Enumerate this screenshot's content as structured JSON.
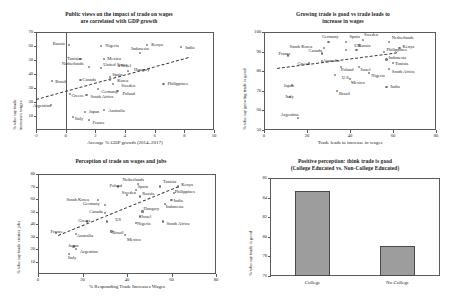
{
  "figure": {
    "panels": [
      "trade-wages-vs-gdp",
      "growing-trade-good-vs-wages",
      "trade-wages-and-jobs",
      "positive-perception-by-education"
    ]
  },
  "chart_data": [
    {
      "id": "trade-wages-vs-gdp",
      "type": "scatter",
      "title": "Public views on the impact of trade on wages",
      "title2": "are correlated with GDP growth",
      "xlabel": "Average % GDP growth (2014–2017)",
      "ylabel": "% who say trade",
      "ylabel2": "increases wages",
      "xlim": [
        -2,
        10
      ],
      "ylim": [
        0,
        70
      ],
      "xticks": [
        -2,
        0,
        2,
        4,
        6,
        8,
        10
      ],
      "yticks": [
        10,
        20,
        30,
        40,
        50,
        60,
        70
      ],
      "grid": false,
      "legend": "none",
      "trendline": {
        "x0": -2,
        "y0": 22,
        "x1": 8.3,
        "y1": 52
      },
      "vline_at": 0,
      "points": [
        {
          "name": "Russia",
          "x": 0.2,
          "y": 61,
          "lx": -20,
          "ly": -1
        },
        {
          "name": "Nigeria",
          "x": 2.4,
          "y": 60,
          "lx": 4,
          "ly": -1
        },
        {
          "name": "Kenya",
          "x": 5.5,
          "y": 61,
          "lx": 4,
          "ly": 0
        },
        {
          "name": "India",
          "x": 7.8,
          "y": 59,
          "lx": 4,
          "ly": 0
        },
        {
          "name": "Indonesia",
          "x": 5.0,
          "y": 55,
          "lx": -7,
          "ly": -5
        },
        {
          "name": "Tunisia",
          "x": 1.0,
          "y": 51,
          "lx": -16,
          "ly": 0
        },
        {
          "name": "Mexico",
          "x": 2.6,
          "y": 51,
          "lx": 3,
          "ly": 0
        },
        {
          "name": "Netherlands",
          "x": 1.6,
          "y": 45,
          "lx": -22,
          "ly": -4
        },
        {
          "name": "Israel",
          "x": 3.6,
          "y": 46,
          "lx": 2,
          "ly": 0
        },
        {
          "name": "United States",
          "x": 2.4,
          "y": 44,
          "lx": 2,
          "ly": -4
        },
        {
          "name": "Hungary",
          "x": 4.2,
          "y": 42,
          "lx": 6,
          "ly": -2
        },
        {
          "name": "Brazil",
          "x": -0.9,
          "y": 35,
          "lx": 3,
          "ly": 0
        },
        {
          "name": "Canada",
          "x": 1.0,
          "y": 36,
          "lx": 2,
          "ly": 0
        },
        {
          "name": "Spain",
          "x": 3.0,
          "y": 38,
          "lx": 2,
          "ly": -2
        },
        {
          "name": "Korea",
          "x": 3.0,
          "y": 36,
          "lx": 7,
          "ly": 1
        },
        {
          "name": "Sweden",
          "x": 3.2,
          "y": 33,
          "lx": 8,
          "ly": 2
        },
        {
          "name": "Philippines",
          "x": 6.6,
          "y": 33,
          "lx": 4,
          "ly": 0
        },
        {
          "name": "Germany",
          "x": 2.2,
          "y": 29,
          "lx": 3,
          "ly": 2
        },
        {
          "name": "Greece",
          "x": 0.3,
          "y": 26,
          "lx": -2,
          "ly": 2
        },
        {
          "name": "South Africa",
          "x": 1.4,
          "y": 25,
          "lx": 4,
          "ly": 1
        },
        {
          "name": "Poland",
          "x": 3.5,
          "y": 28,
          "lx": 5,
          "ly": 3
        },
        {
          "name": "Argentina",
          "x": -1.0,
          "y": 18,
          "lx": -16,
          "ly": 1
        },
        {
          "name": "Japan",
          "x": 1.3,
          "y": 13,
          "lx": 4,
          "ly": 0
        },
        {
          "name": "Australia",
          "x": 2.6,
          "y": 14,
          "lx": 4,
          "ly": 0
        },
        {
          "name": "Italy",
          "x": 0.5,
          "y": 9,
          "lx": 2,
          "ly": 1
        },
        {
          "name": "France",
          "x": 1.6,
          "y": 7,
          "lx": 3,
          "ly": 2
        }
      ]
    },
    {
      "id": "growing-trade-good-vs-wages",
      "type": "scatter",
      "title": "Growing trade is good vs trade leads to",
      "title2": "increase in wages",
      "xlabel": "Trade leads to increase in wages",
      "ylabel": "% who say growing trade is good",
      "xlim": [
        0,
        80
      ],
      "ylim": [
        50,
        100
      ],
      "xticks": [
        0,
        20,
        40,
        60,
        80
      ],
      "yticks": [
        50,
        60,
        70,
        80,
        90,
        100
      ],
      "grid": false,
      "legend": "none",
      "trendline": {
        "x0": 6,
        "y0": 81.5,
        "x1": 62,
        "y1": 89.5
      },
      "points": [
        {
          "name": "Germany",
          "x": 30,
          "y": 95,
          "lx": -6,
          "ly": -5
        },
        {
          "name": "Spain",
          "x": 38,
          "y": 95,
          "lx": -2,
          "ly": -5
        },
        {
          "name": "Sweden",
          "x": 46,
          "y": 96,
          "lx": 1,
          "ly": -5
        },
        {
          "name": "Netherlands",
          "x": 58,
          "y": 95,
          "lx": 3,
          "ly": -4
        },
        {
          "name": "South Korea",
          "x": 28,
          "y": 92,
          "lx": -28,
          "ly": -1
        },
        {
          "name": "Kenya",
          "x": 63,
          "y": 92,
          "lx": 3,
          "ly": -1
        },
        {
          "name": "Canada",
          "x": 27,
          "y": 89,
          "lx": -16,
          "ly": -3
        },
        {
          "name": "UK",
          "x": 38,
          "y": 91,
          "lx": -1,
          "ly": -4
        },
        {
          "name": "Russia",
          "x": 43,
          "y": 91,
          "lx": 2,
          "ly": -4
        },
        {
          "name": "Philippines",
          "x": 56,
          "y": 90,
          "lx": 2,
          "ly": -2
        },
        {
          "name": "France",
          "x": 11,
          "y": 88,
          "lx": -13,
          "ly": -2
        },
        {
          "name": "Indonesia",
          "x": 57,
          "y": 86,
          "lx": 2,
          "ly": -2
        },
        {
          "name": "Australia",
          "x": 27,
          "y": 85,
          "lx": 1,
          "ly": -1
        },
        {
          "name": "Greece",
          "x": 21,
          "y": 84,
          "lx": -15,
          "ly": 0
        },
        {
          "name": "Tunisia",
          "x": 60,
          "y": 84,
          "lx": 2,
          "ly": 0
        },
        {
          "name": "Poland",
          "x": 36,
          "y": 82,
          "lx": -4,
          "ly": 2
        },
        {
          "name": "Israel",
          "x": 44,
          "y": 82,
          "lx": 2,
          "ly": 2
        },
        {
          "name": "South Africa",
          "x": 58,
          "y": 81,
          "lx": 3,
          "ly": 2
        },
        {
          "name": "Nigeria",
          "x": 49,
          "y": 79,
          "lx": 2,
          "ly": 2
        },
        {
          "name": "U.S.",
          "x": 33,
          "y": 78,
          "lx": -1,
          "ly": 2
        },
        {
          "name": "Mexico",
          "x": 40,
          "y": 76,
          "lx": 1,
          "ly": 3
        },
        {
          "name": "Japan",
          "x": 13,
          "y": 73,
          "lx": -14,
          "ly": 0
        },
        {
          "name": "India",
          "x": 57,
          "y": 72,
          "lx": 4,
          "ly": 0
        },
        {
          "name": "Brazil",
          "x": 34,
          "y": 70,
          "lx": -3,
          "ly": 3
        },
        {
          "name": "Italy",
          "x": 12,
          "y": 67,
          "lx": -12,
          "ly": 0
        },
        {
          "name": "Argentina",
          "x": 16,
          "y": 56,
          "lx": -16,
          "ly": -4
        }
      ]
    },
    {
      "id": "trade-wages-and-jobs",
      "type": "scatter",
      "title": "Perception of trade on wages and jobs",
      "xlabel": "% Responding Trade Increases Wages",
      "ylabel": "% who say trade creates jobs",
      "xlim": [
        0,
        80
      ],
      "ylim": [
        0,
        80
      ],
      "xticks": [
        0,
        20,
        40,
        60,
        80
      ],
      "yticks": [
        10,
        20,
        30,
        40,
        50,
        60,
        70,
        80
      ],
      "grid": false,
      "legend": "none",
      "trendline": {
        "x0": 9,
        "y0": 31,
        "x1": 63,
        "y1": 70
      },
      "points": [
        {
          "name": "Kenya",
          "x": 63,
          "y": 70,
          "lx": 3,
          "ly": -2
        },
        {
          "name": "Netherlands",
          "x": 45,
          "y": 72,
          "lx": -12,
          "ly": -5
        },
        {
          "name": "Tunisia",
          "x": 55,
          "y": 70,
          "lx": -2,
          "ly": -5
        },
        {
          "name": "Poland",
          "x": 36,
          "y": 70,
          "lx": -14,
          "ly": -1
        },
        {
          "name": "Spain",
          "x": 44,
          "y": 67,
          "lx": -6,
          "ly": -4
        },
        {
          "name": "Sweden",
          "x": 40,
          "y": 63,
          "lx": -9,
          "ly": -3
        },
        {
          "name": "Philippines",
          "x": 61,
          "y": 65,
          "lx": 1,
          "ly": -1
        },
        {
          "name": "Russia",
          "x": 46,
          "y": 62,
          "lx": -4,
          "ly": -3
        },
        {
          "name": "South Korea",
          "x": 27,
          "y": 59,
          "lx": -27,
          "ly": -1
        },
        {
          "name": "India",
          "x": 60,
          "y": 59,
          "lx": 2,
          "ly": 0
        },
        {
          "name": "Germany",
          "x": 30,
          "y": 55,
          "lx": -23,
          "ly": -2
        },
        {
          "name": "Indonesia",
          "x": 57,
          "y": 56,
          "lx": 1,
          "ly": 2
        },
        {
          "name": "Hungary",
          "x": 47,
          "y": 50,
          "lx": 1,
          "ly": -3
        },
        {
          "name": "Canada",
          "x": 30,
          "y": 49,
          "lx": -20,
          "ly": -1
        },
        {
          "name": "Israel",
          "x": 46,
          "y": 46,
          "lx": 1,
          "ly": 0
        },
        {
          "name": "US",
          "x": 31,
          "y": 42,
          "lx": -4,
          "ly": -2
        },
        {
          "name": "Greece",
          "x": 22,
          "y": 42,
          "lx": -14,
          "ly": -1
        },
        {
          "name": "Nigeria",
          "x": 44,
          "y": 41,
          "lx": 1,
          "ly": 1
        },
        {
          "name": "South Africa",
          "x": 56,
          "y": 42,
          "lx": 4,
          "ly": 2
        },
        {
          "name": "France",
          "x": 8,
          "y": 33,
          "lx": -11,
          "ly": -1
        },
        {
          "name": "Australia",
          "x": 17,
          "y": 32,
          "lx": 1,
          "ly": 1
        },
        {
          "name": "Brazil",
          "x": 33,
          "y": 34,
          "lx": 1,
          "ly": 1
        },
        {
          "name": "Mexico",
          "x": 39,
          "y": 31,
          "lx": -2,
          "ly": 4
        },
        {
          "name": "Japan",
          "x": 16,
          "y": 22,
          "lx": -13,
          "ly": -1
        },
        {
          "name": "Argentina",
          "x": 17,
          "y": 20,
          "lx": 4,
          "ly": 2
        },
        {
          "name": "Italy",
          "x": 14,
          "y": 16,
          "lx": -11,
          "ly": 3
        }
      ]
    },
    {
      "id": "positive-perception-by-education",
      "type": "bar",
      "title": "Positive perception: think trade is good",
      "title2": "(College Educated vs. Non-College Educated)",
      "xlabel": "",
      "ylabel": "% who say trade is good",
      "categories": [
        "College",
        "No College"
      ],
      "values": [
        84.7,
        79.1
      ],
      "ylim": [
        76,
        86
      ],
      "yticks": [
        76,
        78,
        80,
        82,
        84,
        86
      ],
      "grid": false,
      "legend": "none",
      "bar_color": "#9d9d9d"
    }
  ]
}
